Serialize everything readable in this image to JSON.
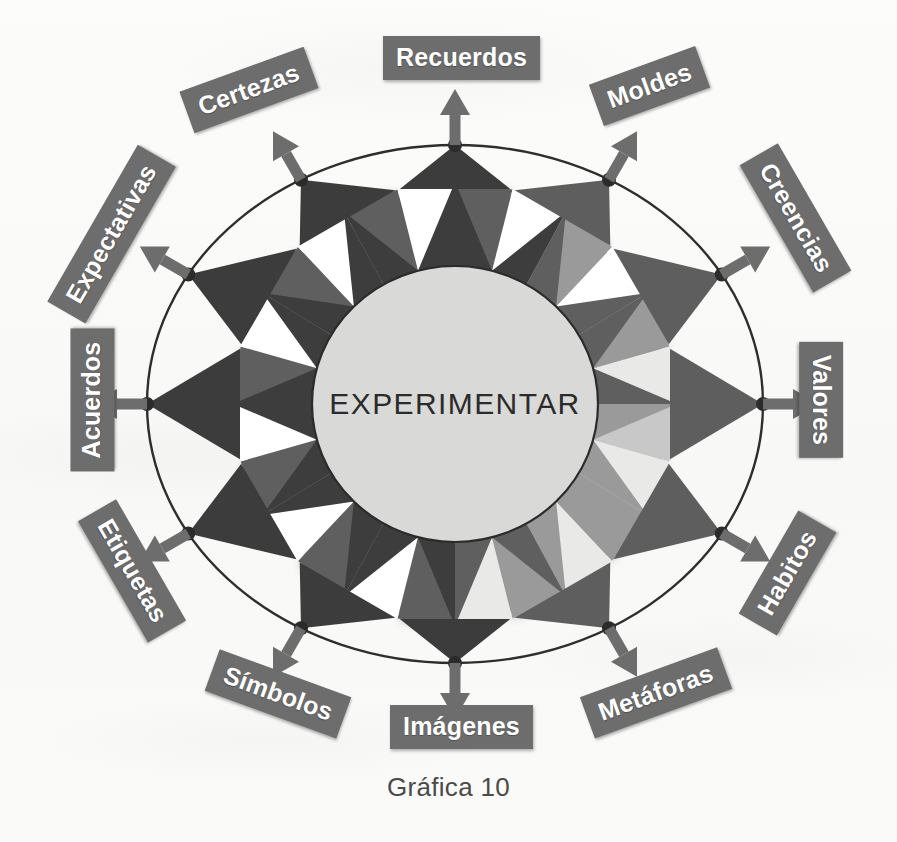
{
  "figure": {
    "caption": "Gráfica 10",
    "center_label": "EXPERIMENTAR"
  },
  "colors": {
    "plaque_background": "#6d6d6d",
    "plaque_text": "#ffffff",
    "facet_dark": "#3c3c3c",
    "facet_mid": "#5e5e5e",
    "facet_light": "#9a9a9a",
    "facet_pale": "#c8c8c8",
    "center_fill": "#d9d9d7",
    "ring_outline": "#2e2e2e",
    "background": "#fbfbfa",
    "arrow": "#6d6d6d"
  },
  "chart_data": {
    "type": "diagram",
    "title": "Gráfica 10",
    "center": "EXPERIMENTAR",
    "spoke_count": 12,
    "nodes": [
      {
        "label": "Recuerdos",
        "angle_deg": -90,
        "rotation_deg": 0,
        "x": 455,
        "y": 60
      },
      {
        "label": "Moldes",
        "angle_deg": -60,
        "rotation_deg": -20,
        "x": 645,
        "y": 92
      },
      {
        "label": "Creencias",
        "angle_deg": -30,
        "rotation_deg": -60,
        "x": 789,
        "y": 222
      },
      {
        "label": "Valores",
        "angle_deg": 0,
        "rotation_deg": -90,
        "x": 818,
        "y": 404
      },
      {
        "label": "Habitos",
        "angle_deg": 30,
        "rotation_deg": -240,
        "x": 786,
        "y": 578
      },
      {
        "label": "Metáforas",
        "angle_deg": 60,
        "rotation_deg": -200,
        "x": 650,
        "y": 700
      },
      {
        "label": "Imágenes",
        "angle_deg": 90,
        "rotation_deg": 0,
        "x": 455,
        "y": 729
      },
      {
        "label": "Símbolos",
        "angle_deg": 120,
        "rotation_deg": 20,
        "x": 268,
        "y": 699
      },
      {
        "label": "Etiquetas",
        "angle_deg": 150,
        "rotation_deg": 60,
        "x": 120,
        "y": 575
      },
      {
        "label": "Acuerdos",
        "angle_deg": 180,
        "rotation_deg": 90,
        "x": 78,
        "y": 404
      },
      {
        "label": "Expectativas",
        "angle_deg": 210,
        "rotation_deg": 60,
        "x": 104,
        "y": 240
      },
      {
        "label": "Certezas",
        "angle_deg": 240,
        "rotation_deg": -20,
        "x": 244,
        "y": 95
      }
    ],
    "labels": [
      "Recuerdos",
      "Moldes",
      "Creencias",
      "Valores",
      "Habitos",
      "Metáforas",
      "Imágenes",
      "Símbolos",
      "Etiquetas",
      "Acuerdos",
      "Expectativas",
      "Certezas"
    ],
    "legend": []
  }
}
